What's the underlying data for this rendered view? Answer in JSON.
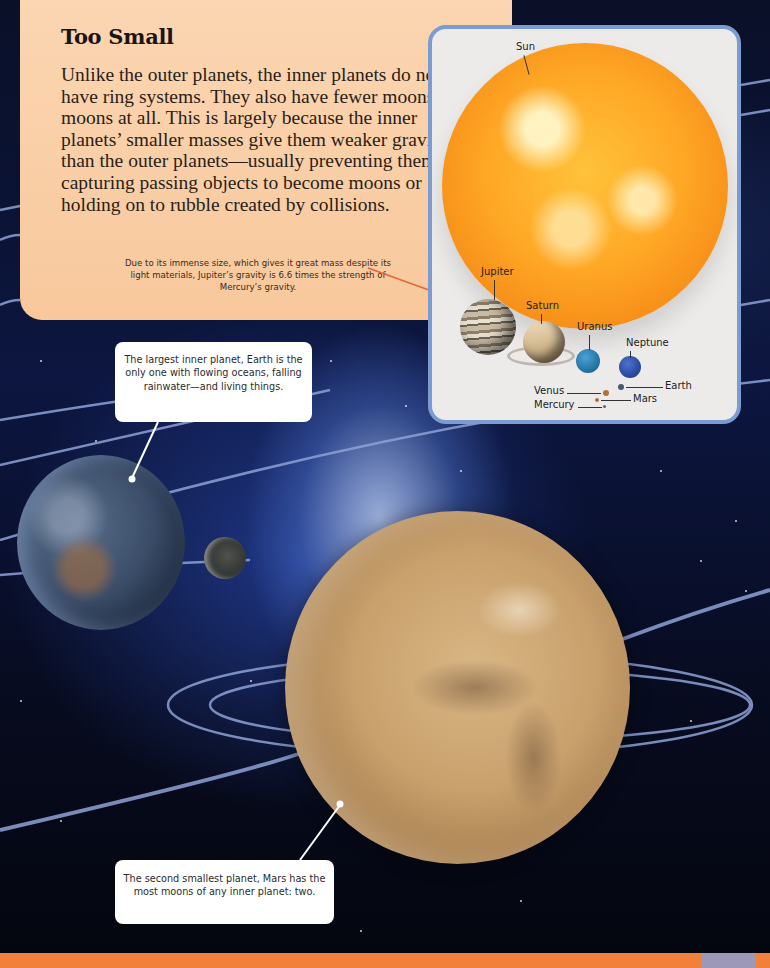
{
  "panel": {
    "title": "Too Small",
    "body": "Unlike the outer planets, the inner planets do not have ring systems. They also have fewer moons or no moons at all. This is largely because the inner planets’ smaller masses give them weaker gravity than the outer planets—usually preventing them from capturing passing objects to become moons or holding on to rubble created by collisions.",
    "caption": "Due to its immense size, which gives it great mass despite its light materials, Jupiter’s gravity is 6.6 times the strength of Mercury’s gravity."
  },
  "inset": {
    "labels": {
      "sun": "Sun",
      "jupiter": "Jupiter",
      "saturn": "Saturn",
      "uranus": "Uranus",
      "neptune": "Neptune",
      "earth": "Earth",
      "venus": "Venus",
      "mars": "Mars",
      "mercury": "Mercury"
    }
  },
  "callouts": {
    "earth": "The largest inner planet, Earth is the only one with flowing oceans, falling rainwater—and living things.",
    "mars": "The second smallest planet, Mars has the most moons of any inner planet: two."
  },
  "colors": {
    "panel_bg": "#f8c89c",
    "inset_border": "#7b9cd0",
    "bottom_bar": "#f27f3a",
    "bottom_bar_accent": "#9e98b8",
    "caption_pointer": "#e8643a"
  }
}
